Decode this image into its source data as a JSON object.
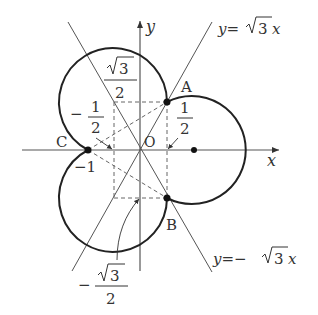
{
  "diagram": {
    "type": "cardioid-like trefoil of three unit circles on xy-plane",
    "colors": {
      "ink": "#222222",
      "axis": "#555555",
      "dashed": "#666666",
      "text": "#333333",
      "background": "#ffffff"
    },
    "axes": {
      "x_label": "x",
      "y_label": "y",
      "origin_label": "O"
    },
    "lines": [
      {
        "id": "line-sqrt3",
        "label_prefix": "y=",
        "label_root": "3",
        "label_suffix": " x",
        "equation": "y=√3 x"
      },
      {
        "id": "line-neg-sqrt3",
        "label_prefix": "y=−",
        "label_root": "3",
        "label_suffix": " x",
        "equation": "y=−√3 x"
      }
    ],
    "points": [
      {
        "label": "A",
        "coords": "(1/2, √3/2)"
      },
      {
        "label": "B",
        "coords": "(1/2, −√3/2)"
      },
      {
        "label": "C",
        "coords": "(−1, 0)"
      }
    ],
    "annotations": {
      "sqrt3_over_2": {
        "sign": "",
        "root": "3",
        "den": "2"
      },
      "neg_half": {
        "sign": "−",
        "num": "1",
        "den": "2"
      },
      "half": {
        "num": "1",
        "den": "2"
      },
      "neg_one": "−1",
      "neg_sqrt3_over_2": {
        "sign": "−",
        "root": "3",
        "den": "2"
      }
    }
  }
}
